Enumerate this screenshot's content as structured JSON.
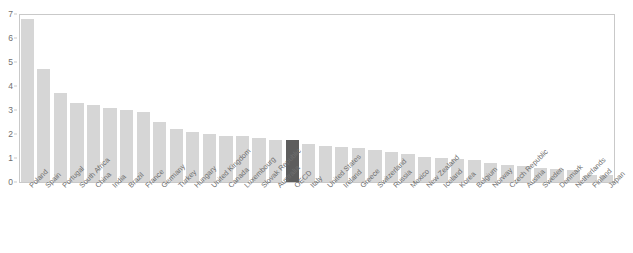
{
  "chart_data": {
    "type": "bar",
    "title": "",
    "subtitle": "",
    "xlabel": "",
    "ylabel": "",
    "ylim": [
      0,
      7
    ],
    "yticks": [
      0,
      1,
      2,
      3,
      4,
      5,
      6,
      7
    ],
    "ytick_labels": [
      "0",
      "1",
      "2",
      "3",
      "4",
      "5",
      "6",
      "7"
    ],
    "grid": false,
    "legend": "none",
    "highlight_category": "OECD",
    "colors": {
      "bar": "#d6d6d6",
      "highlight_bar": "#5d5d5d",
      "axis": "#c9c9c9",
      "text": "#6f6f6f",
      "background": "#ffffff"
    },
    "categories": [
      "Poland",
      "Spain",
      "Portugal",
      "South Africa",
      "China",
      "India",
      "Brazil",
      "France",
      "Germany",
      "Turkey",
      "Hungary",
      "United Kingdom",
      "Canada",
      "Luxembourg",
      "Slovak Republic",
      "Australia",
      "OECD",
      "Italy",
      "United States",
      "Ireland",
      "Greece",
      "Switzerland",
      "Russia",
      "Mexico",
      "New Zealand",
      "Iceland",
      "Korea",
      "Belgium",
      "Norway",
      "Czech Republic",
      "Austria",
      "Sweden",
      "Denmark",
      "Netherlands",
      "Finland",
      "Japan"
    ],
    "values": [
      6.8,
      4.7,
      3.7,
      3.3,
      3.2,
      3.1,
      3.0,
      2.9,
      2.5,
      2.2,
      2.1,
      2.0,
      1.9,
      1.9,
      1.85,
      1.75,
      1.75,
      1.6,
      1.5,
      1.45,
      1.4,
      1.35,
      1.25,
      1.15,
      1.05,
      1.0,
      0.95,
      0.9,
      0.8,
      0.7,
      0.65,
      0.6,
      0.55,
      0.5,
      0.3,
      0.3
    ]
  }
}
